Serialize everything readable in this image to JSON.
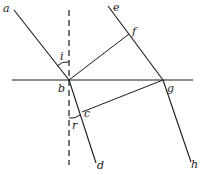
{
  "diagram": {
    "type": "refraction-wavefront",
    "stroke_color": "#1a1a1a",
    "labels": {
      "a": "a",
      "b": "b",
      "c": "c",
      "d": "d",
      "e": "e",
      "f": "f",
      "g": "g",
      "h": "h",
      "i": "i",
      "r": "r"
    }
  }
}
